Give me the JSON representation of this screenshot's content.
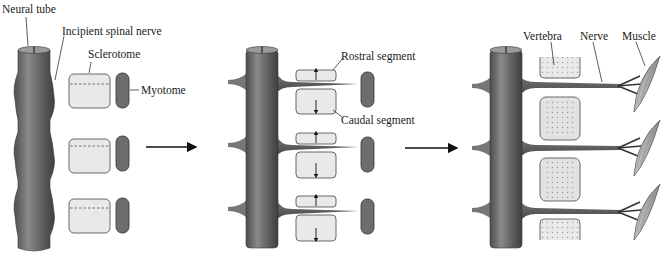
{
  "colors": {
    "tube": "#6b6b6b",
    "tube_dark": "#4a4a4a",
    "sclerotome_fill": "#e9e9e9",
    "myotome_fill": "#6d6d6d",
    "outline": "#444444",
    "arrow": "#111111"
  },
  "panels": [
    {
      "id": "stage-1",
      "labels": {
        "neural_tube": "Neural tube",
        "incipient_spinal_nerve": "Incipient spinal nerve",
        "sclerotome": "Sclerotome",
        "myotome": "Myotome"
      }
    },
    {
      "id": "stage-2",
      "labels": {
        "rostral_segment": "Rostral segment",
        "caudal_segment": "Caudal segment"
      }
    },
    {
      "id": "stage-3",
      "labels": {
        "vertebra": "Vertebra",
        "nerve": "Nerve",
        "muscle": "Muscle"
      }
    }
  ],
  "arrows": [
    {
      "from": "stage-1",
      "to": "stage-2",
      "icon": "right-arrow-icon"
    },
    {
      "from": "stage-2",
      "to": "stage-3",
      "icon": "right-arrow-icon"
    }
  ]
}
